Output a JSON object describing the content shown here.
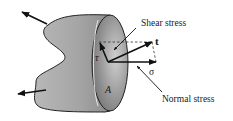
{
  "diagram": {
    "type": "free-body stress diagram",
    "labels": {
      "shear_stress": "Shear stress",
      "normal_stress": "Normal stress",
      "traction_vector": "t",
      "normal_component": "σ",
      "shear_component": "τ",
      "area": "A"
    },
    "colors": {
      "body_fill": "#a9a9a9",
      "body_fill_light": "#c4c4c4",
      "face_fill": "#7a7a7a",
      "outline": "#222222",
      "arrow": "#111111",
      "dashed": "#333333",
      "background": "#ffffff"
    }
  }
}
